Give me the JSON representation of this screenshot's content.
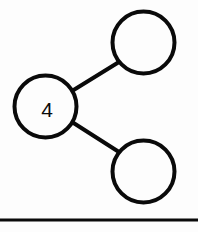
{
  "canvas": {
    "width": 198,
    "height": 232,
    "background_color": "#fdfdfd",
    "ink_color": "#0a0a0a"
  },
  "diagram": {
    "type": "node-link-graph",
    "node_radius": 31,
    "node_stroke_width": 4,
    "edge_stroke_width": 4,
    "nodes": [
      {
        "id": "node-labeled-4",
        "label": "4",
        "cx": 45.5,
        "cy": 106.5,
        "r": 31,
        "label_x": 47,
        "label_y": 109,
        "filled": false
      },
      {
        "id": "node-top-right",
        "label": "",
        "cx": 143.5,
        "cy": 42.5,
        "r": 31,
        "label_x": 143.5,
        "label_y": 42.5,
        "filled": false
      },
      {
        "id": "node-bottom-right",
        "label": "",
        "cx": 143.5,
        "cy": 171.5,
        "r": 31,
        "label_x": 143.5,
        "label_y": 171.5,
        "filled": false
      }
    ],
    "edges": [
      {
        "id": "edge-4-to-top-right",
        "from": "node-labeled-4",
        "to": "node-top-right",
        "x1": 72,
        "y1": 91,
        "x2": 119,
        "y2": 62
      },
      {
        "id": "edge-4-to-bottom-right",
        "from": "node-labeled-4",
        "to": "node-bottom-right",
        "x1": 72,
        "y1": 122,
        "x2": 119,
        "y2": 152
      }
    ]
  },
  "divider": {
    "y": 220,
    "x1": 0,
    "x2": 198,
    "stroke_width": 3
  }
}
